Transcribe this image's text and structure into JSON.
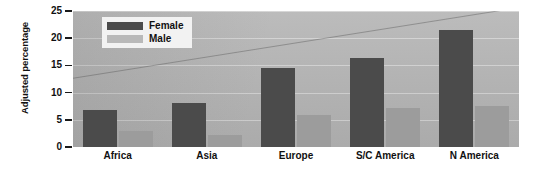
{
  "chart_data": {
    "type": "bar",
    "title": "",
    "xlabel": "",
    "ylabel": "Adjusted percentage",
    "categories": [
      "Africa",
      "Asia",
      "Europe",
      "S/C America",
      "N America"
    ],
    "series": [
      {
        "name": "Female",
        "color": "#4b4b4b",
        "values": [
          6.8,
          8.1,
          14.5,
          16.4,
          21.5
        ]
      },
      {
        "name": "Male",
        "color": "#9c9c9c",
        "values": [
          3.0,
          2.2,
          5.9,
          7.2,
          7.6
        ]
      }
    ],
    "ylim": [
      0,
      25
    ],
    "yticks": [
      0,
      5,
      10,
      15,
      20,
      25
    ],
    "ytick_labels": [
      "0",
      "5",
      "10",
      "15",
      "20",
      "25"
    ],
    "grid": true,
    "legend_position": "top-left",
    "plot_background": "#b4b4b4",
    "page_background": "#ffffff"
  },
  "legend": {
    "entries": [
      {
        "label": "Female",
        "color": "#4b4b4b"
      },
      {
        "label": "Male",
        "color": "#b9b9b9"
      }
    ]
  }
}
